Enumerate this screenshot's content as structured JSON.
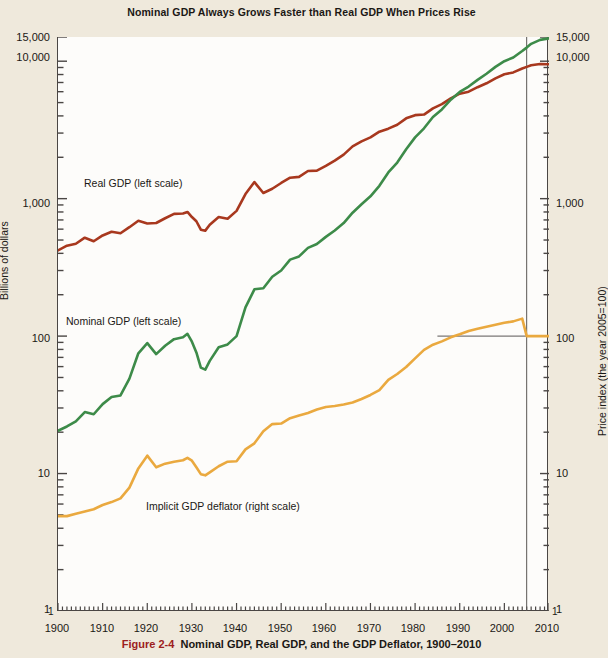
{
  "title": "Nominal GDP Always Grows Faster than Real GDP When Prices Rise",
  "caption": {
    "figure_number": "Figure 2-4",
    "text": "Nominal GDP, Real GDP, and the GDP Deflator, 1900–2010"
  },
  "axes": {
    "left_title": "Billions of dollars",
    "right_title": "Price index (the year 2005=100)",
    "left_ticks": [
      "15,000",
      "10,000",
      "1,000",
      "100",
      "10",
      "1"
    ],
    "right_ticks": [
      "15,000",
      "10,000",
      "1,000",
      "100",
      "10",
      "1"
    ],
    "x_ticks": [
      "1900",
      "1910",
      "1920",
      "1930",
      "1940",
      "1950",
      "1960",
      "1970",
      "1980",
      "1990",
      "2000",
      "2010"
    ],
    "left_end_low": "1",
    "right_end_low": "1"
  },
  "annotations": {
    "real": "Real GDP (left scale)",
    "nominal": "Nominal GDP (left scale)",
    "deflator": "Implicit GDP deflator (right scale)"
  },
  "colors": {
    "real_gdp": "#a8381e",
    "nominal_gdp": "#3d8b49",
    "deflator": "#eaa93f",
    "frame": "#4a4644",
    "reference_line": "#5a5654",
    "page_background": "#efe9dc",
    "plot_background": "#fdfcfa",
    "figure_number": "#9c2020"
  },
  "chart_data": {
    "type": "line",
    "title": "Nominal GDP Always Grows Faster than Real GDP When Prices Rise",
    "xlabel": "",
    "ylabel": "Billions of dollars",
    "y2label": "Price index (the year 2005=100)",
    "yscale": "log",
    "ylim": [
      1,
      15000
    ],
    "y2lim": [
      1,
      15000
    ],
    "xlim": [
      1900,
      2010
    ],
    "grid": false,
    "legend": "inline-annotations",
    "reference_lines": [
      {
        "type": "vertical",
        "x": 2005,
        "label": "base year 2005"
      },
      {
        "type": "horizontal",
        "y": 100,
        "label": "price index = 100",
        "x_from": 1985,
        "x_to": 2010
      }
    ],
    "x": [
      1900,
      1902,
      1904,
      1906,
      1908,
      1910,
      1912,
      1914,
      1916,
      1918,
      1920,
      1922,
      1924,
      1926,
      1928,
      1929,
      1930,
      1931,
      1932,
      1933,
      1934,
      1936,
      1938,
      1940,
      1942,
      1944,
      1946,
      1948,
      1950,
      1952,
      1954,
      1956,
      1958,
      1960,
      1962,
      1964,
      1966,
      1968,
      1970,
      1972,
      1974,
      1976,
      1978,
      1980,
      1982,
      1984,
      1986,
      1988,
      1990,
      1992,
      1994,
      1996,
      1998,
      2000,
      2002,
      2004,
      2005,
      2006,
      2008,
      2010
    ],
    "series": [
      {
        "name": "Real GDP (left scale)",
        "color": "#a8381e",
        "axis": "left",
        "units": "Billions of 2005 dollars",
        "values": [
          420,
          455,
          470,
          520,
          490,
          540,
          575,
          560,
          620,
          690,
          660,
          665,
          720,
          775,
          780,
          800,
          735,
          685,
          595,
          585,
          645,
          735,
          715,
          815,
          1080,
          1320,
          1100,
          1180,
          1300,
          1420,
          1440,
          1590,
          1600,
          1730,
          1890,
          2090,
          2400,
          2610,
          2790,
          3070,
          3230,
          3450,
          3840,
          4050,
          4090,
          4540,
          4870,
          5360,
          5800,
          6000,
          6470,
          6910,
          7500,
          8030,
          8290,
          8850,
          9090,
          9350,
          9550,
          9500
        ]
      },
      {
        "name": "Nominal GDP (left scale)",
        "color": "#3d8b49",
        "axis": "left",
        "units": "Billions of current dollars",
        "values": [
          20.5,
          22,
          24,
          28,
          27,
          32,
          36,
          37,
          49,
          75,
          89,
          74,
          85,
          95,
          98,
          104,
          91,
          76,
          59,
          57,
          66,
          83,
          87,
          100,
          162,
          219,
          223,
          270,
          300,
          360,
          380,
          438,
          468,
          527,
          586,
          664,
          790,
          911,
          1040,
          1240,
          1550,
          1830,
          2290,
          2790,
          3250,
          3930,
          4460,
          5250,
          5980,
          6540,
          7310,
          8100,
          9090,
          10000,
          10640,
          11850,
          12560,
          13380,
          14290,
          14660
        ]
      },
      {
        "name": "Implicit GDP deflator (right scale)",
        "color": "#eaa93f",
        "axis": "right",
        "units": "Index, 2005 = 100",
        "values": [
          4.9,
          4.9,
          5.1,
          5.3,
          5.5,
          5.9,
          6.2,
          6.6,
          7.9,
          10.9,
          13.5,
          11.1,
          11.8,
          12.2,
          12.5,
          13.0,
          12.4,
          11.1,
          9.9,
          9.7,
          10.2,
          11.3,
          12.2,
          12.3,
          15.0,
          16.6,
          20.3,
          22.9,
          23.1,
          25.3,
          26.4,
          27.6,
          29.2,
          30.5,
          31.0,
          31.8,
          32.9,
          34.9,
          37.3,
          40.4,
          48.0,
          53.0,
          59.6,
          68.9,
          79.4,
          86.6,
          91.5,
          98.0,
          103.0,
          109.0,
          113.0,
          117.0,
          121.0,
          125.0,
          128.0,
          134.0,
          100.0,
          100.0,
          100.0,
          100.0
        ]
      }
    ]
  }
}
